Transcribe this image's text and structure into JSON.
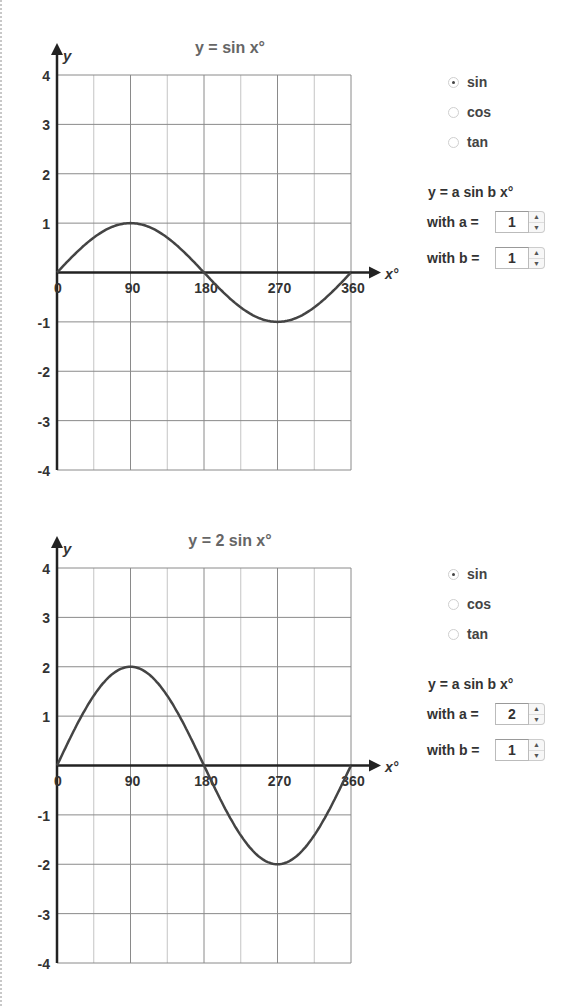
{
  "panels": [
    {
      "title": "y =  sin  x°",
      "x_axis_label": "x°",
      "y_axis_label": "y",
      "x_ticks": [
        "0",
        "90",
        "180",
        "270",
        "360"
      ],
      "y_ticks": [
        "4",
        "3",
        "2",
        "1",
        "-1",
        "-2",
        "-3",
        "-4"
      ],
      "radio_options": [
        {
          "label": "sin",
          "checked": true
        },
        {
          "label": "cos",
          "checked": false
        },
        {
          "label": "tan",
          "checked": false
        }
      ],
      "formula": "y = a sin b x°",
      "param_a_label": "with a =",
      "param_a_value": "1",
      "param_b_label": "with b =",
      "param_b_value": "1"
    },
    {
      "title": "y = 2 sin  x°",
      "x_axis_label": "x°",
      "y_axis_label": "y",
      "x_ticks": [
        "0",
        "90",
        "180",
        "270",
        "360"
      ],
      "y_ticks": [
        "4",
        "3",
        "2",
        "1",
        "-1",
        "-2",
        "-3",
        "-4"
      ],
      "radio_options": [
        {
          "label": "sin",
          "checked": true
        },
        {
          "label": "cos",
          "checked": false
        },
        {
          "label": "tan",
          "checked": false
        }
      ],
      "formula": "y = a sin b x°",
      "param_a_label": "with a =",
      "param_a_value": "2",
      "param_b_label": "with b =",
      "param_b_value": "1"
    }
  ],
  "colors": {
    "curve": "#444444",
    "grid": "#999999",
    "axis": "#222222",
    "text": "#333333"
  },
  "chart_data": [
    {
      "type": "line",
      "title": "y =  sin  x°",
      "xlabel": "x°",
      "ylabel": "y",
      "x": [
        0,
        45,
        90,
        135,
        180,
        225,
        270,
        315,
        360
      ],
      "series": [
        {
          "name": "y = sin x°",
          "values": [
            0,
            0.71,
            1,
            0.71,
            0,
            -0.71,
            -1,
            -0.71,
            0
          ]
        }
      ],
      "xlim": [
        0,
        360
      ],
      "ylim": [
        -4,
        4
      ],
      "x_tick_labels": [
        "0",
        "90",
        "180",
        "270",
        "360"
      ],
      "y_tick_labels": [
        "-4",
        "-3",
        "-2",
        "-1",
        "1",
        "2",
        "3",
        "4"
      ],
      "grid": true,
      "grid_x_step": 45,
      "grid_y_step": 1
    },
    {
      "type": "line",
      "title": "y = 2 sin  x°",
      "xlabel": "x°",
      "ylabel": "y",
      "x": [
        0,
        45,
        90,
        135,
        180,
        225,
        270,
        315,
        360
      ],
      "series": [
        {
          "name": "y = 2 sin x°",
          "values": [
            0,
            1.41,
            2,
            1.41,
            0,
            -1.41,
            -2,
            -1.41,
            0
          ]
        }
      ],
      "xlim": [
        0,
        360
      ],
      "ylim": [
        -4,
        4
      ],
      "x_tick_labels": [
        "0",
        "90",
        "180",
        "270",
        "360"
      ],
      "y_tick_labels": [
        "-4",
        "-3",
        "-2",
        "-1",
        "1",
        "2",
        "3",
        "4"
      ],
      "grid": true,
      "grid_x_step": 45,
      "grid_y_step": 1
    }
  ]
}
